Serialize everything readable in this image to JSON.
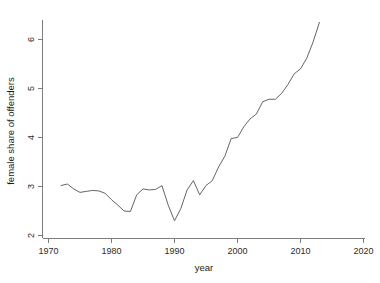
{
  "chart_data": {
    "type": "line",
    "title": "",
    "xlabel": "year",
    "ylabel": "female share of offenders",
    "xlim": [
      1970,
      2020
    ],
    "ylim": [
      1.75,
      6.6
    ],
    "xticks": [
      1970,
      1980,
      1990,
      2000,
      2010,
      2020
    ],
    "yticks": [
      2,
      3,
      4,
      5,
      6
    ],
    "grid": false,
    "legend": null,
    "series": [
      {
        "name": "female share of offenders",
        "x": [
          1972,
          1973,
          1974,
          1975,
          1976,
          1977,
          1978,
          1979,
          1980,
          1981,
          1982,
          1983,
          1984,
          1985,
          1986,
          1987,
          1988,
          1989,
          1990,
          1991,
          1992,
          1993,
          1994,
          1995,
          1996,
          1997,
          1998,
          1999,
          2000,
          2001,
          2002,
          2003,
          2004,
          2005,
          2006,
          2007,
          2008,
          2009,
          2010,
          2011,
          2012,
          2013
        ],
        "y": [
          3.02,
          3.05,
          2.95,
          2.88,
          2.9,
          2.92,
          2.91,
          2.86,
          2.73,
          2.62,
          2.5,
          2.49,
          2.83,
          2.95,
          2.93,
          2.94,
          3.02,
          2.62,
          2.3,
          2.55,
          2.93,
          3.12,
          2.83,
          3.02,
          3.12,
          3.4,
          3.62,
          3.98,
          4.0,
          4.22,
          4.38,
          4.48,
          4.73,
          4.78,
          4.78,
          4.9,
          5.08,
          5.3,
          5.4,
          5.62,
          5.95,
          6.35
        ]
      }
    ]
  },
  "figure": {
    "background": "#ffffff",
    "line_color": "#5d5d5d",
    "axis_color": "#6e6e6e"
  }
}
